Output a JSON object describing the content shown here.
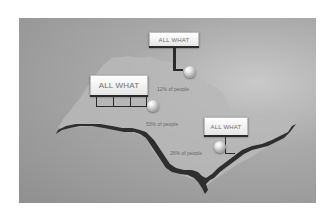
{
  "panel": {
    "background": "#a3a3a3",
    "land_color": "#b9b9b9",
    "river_color": "#2e2e2e"
  },
  "billboards": [
    {
      "id": "top",
      "text": "ALL WHAT"
    },
    {
      "id": "left",
      "text": "ALL WHAT"
    },
    {
      "id": "right",
      "text": "ALL WHAT"
    }
  ],
  "markers": [
    {
      "id": "top",
      "label": "12% of people"
    },
    {
      "id": "left",
      "label": "53% of people"
    },
    {
      "id": "right",
      "label": "26% of people"
    }
  ]
}
